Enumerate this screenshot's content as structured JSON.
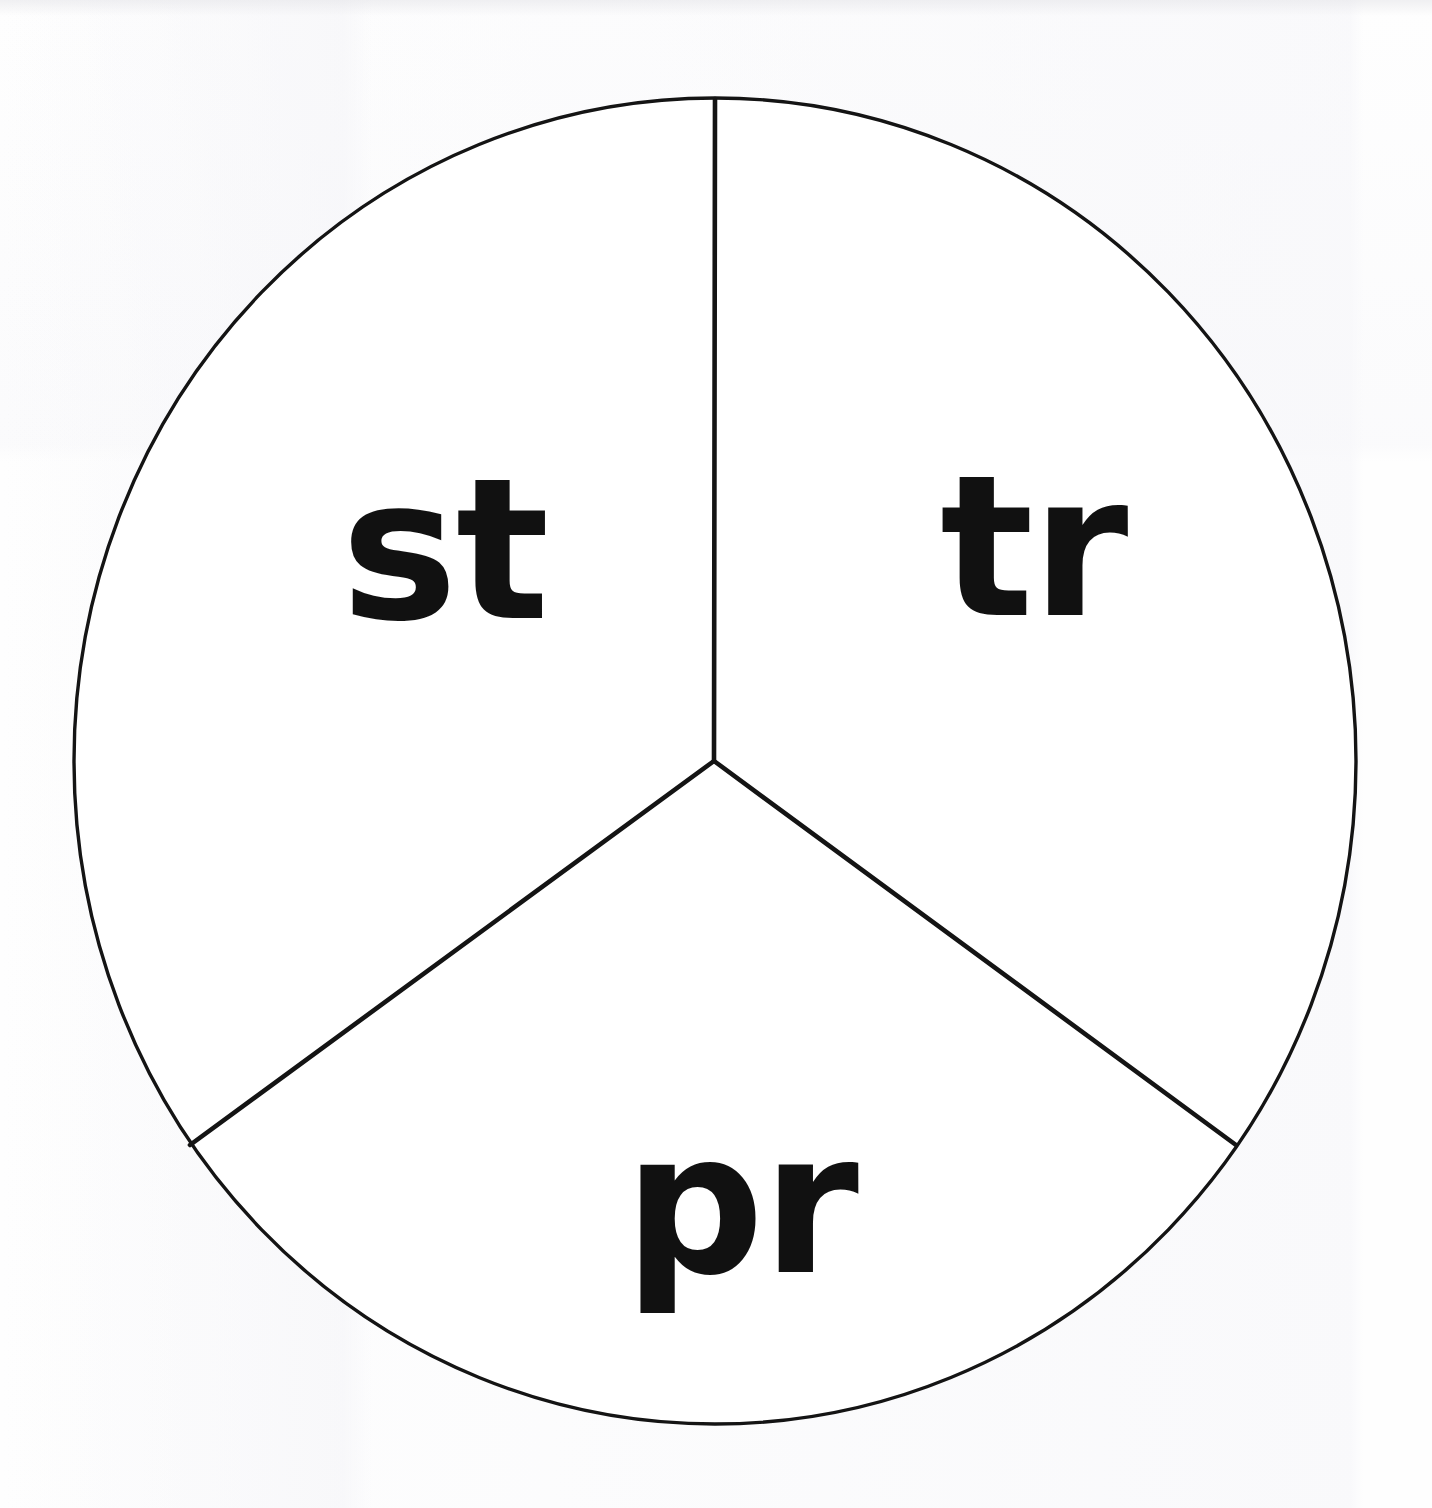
{
  "worksheet": {
    "kind": "spinner-wheel",
    "shape": "circle-divided-in-thirds",
    "segment_count": 3,
    "segments": [
      {
        "id": "st",
        "label": "st",
        "position": "upper-left"
      },
      {
        "id": "tr",
        "label": "tr",
        "position": "upper-right"
      },
      {
        "id": "pr",
        "label": "pr",
        "position": "bottom"
      }
    ],
    "colors": {
      "background": "#fefefe",
      "outline": "#141414",
      "divider": "#141414",
      "label_text": "#111111"
    },
    "geometry": {
      "center_x": 715,
      "center_y": 761,
      "radius_x": 644,
      "radius_y": 664,
      "outline_width": 3,
      "divider_width": 5,
      "spoke_angles_deg": [
        270,
        30,
        150
      ]
    }
  }
}
